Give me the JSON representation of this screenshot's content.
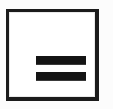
{
  "icon": {
    "name": "equals-sign-icon",
    "glyph": "=",
    "alt_label": "Equals",
    "shape": "square-framed-button",
    "symbol_meaning": "equals",
    "bar_count": 2,
    "colors": {
      "background": "#fcfcfc",
      "frame_fill": "#ffffff",
      "frame_stroke": "#1b1b1b",
      "bar_fill": "#141414",
      "bar_edge": "#3a3a3a",
      "inner_seam": "#e9e9e9"
    },
    "geometry": {
      "canvas_width": 113,
      "canvas_height": 109,
      "frame_left": 6,
      "frame_top": 9,
      "frame_width": 93,
      "frame_height": 92,
      "frame_border_width": 3,
      "bar_left": 27,
      "bar_width": 50,
      "bar_height": 9,
      "bar_top_y": 44,
      "bar_bottom_y": 60,
      "bar_gap": 7
    }
  }
}
